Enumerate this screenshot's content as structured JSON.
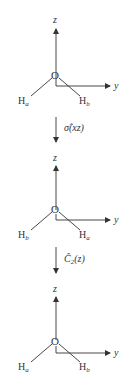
{
  "diagram": {
    "stages": [
      {
        "id": "initial",
        "center_atom": "O",
        "axis_z": "z",
        "axis_y": "y",
        "left_h": {
          "base": "H",
          "sub": "a"
        },
        "right_h": {
          "base": "H",
          "sub": "b"
        }
      },
      {
        "id": "after-sigma",
        "center_atom": "O",
        "axis_z": "z",
        "axis_y": "y",
        "left_h": {
          "base": "H",
          "sub": "b"
        },
        "right_h": {
          "base": "H",
          "sub": "a"
        }
      },
      {
        "id": "after-c2",
        "center_atom": "O",
        "axis_z": "z",
        "axis_y": "y",
        "left_h": {
          "base": "H",
          "sub": "a"
        },
        "right_h": {
          "base": "H",
          "sub": "b"
        }
      }
    ],
    "operations": [
      {
        "symbol": "σ̂",
        "args": "(xz)"
      },
      {
        "symbol": "Ĉ",
        "sub": "2",
        "args": "(z)"
      }
    ],
    "colors": {
      "line": "#333333",
      "text": "#333333",
      "background": "#ffffff"
    }
  }
}
